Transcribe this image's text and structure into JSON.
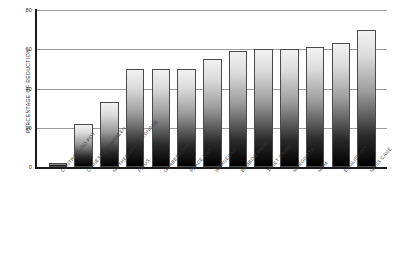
{
  "chart_data": {
    "type": "bar",
    "title": "",
    "xlabel": "",
    "ylabel": "PERCENTAGE OF REDUCTION",
    "ylim": [
      0,
      80
    ],
    "yticks": [
      0,
      20,
      40,
      60,
      80
    ],
    "grid": true,
    "legend": "none",
    "categories": [
      "CONTROL—NO POT",
      "CHINESE EVERGREEN",
      "MOTHER-IN-LAW TONGUE",
      "FICUS",
      "GERBERA DAISY",
      "PEACE LILY",
      "WARNECKII",
      "BAMBOO PALM",
      "JANET CRAIG",
      "MARGINATA",
      "MUM",
      "ENGLISH IVY",
      "MASS CANE"
    ],
    "values": [
      2,
      22,
      33,
      50,
      50,
      50,
      55,
      59,
      60,
      60,
      61,
      63,
      70
    ]
  }
}
